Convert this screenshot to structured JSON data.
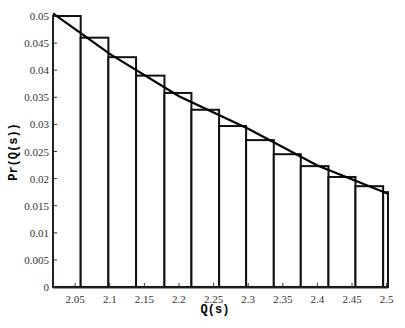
{
  "chart_data": {
    "type": "bar",
    "title": "",
    "xlabel": "Q(s)",
    "ylabel": "Pr(Q(s))",
    "xlim": [
      2.018,
      2.502
    ],
    "ylim": [
      0,
      0.05
    ],
    "x_ticks": [
      "2.05",
      "2.1",
      "2.15",
      "2.2",
      "2.25",
      "2.3",
      "2.35",
      "2.4",
      "2.45",
      "2.5"
    ],
    "y_ticks": [
      "0",
      "0.005",
      "0.01",
      "0.015",
      "0.02",
      "0.025",
      "0.03",
      "0.035",
      "0.04",
      "0.045",
      "0.05"
    ],
    "bin_edges": [
      2.018,
      2.058,
      2.098,
      2.138,
      2.179,
      2.218,
      2.258,
      2.297,
      2.337,
      2.376,
      2.416,
      2.455,
      2.495,
      2.502
    ],
    "values": [
      0.05,
      0.046,
      0.0424,
      0.039,
      0.0358,
      0.0327,
      0.0297,
      0.0271,
      0.0245,
      0.0223,
      0.0203,
      0.0186,
      0.0175
    ],
    "series": [
      {
        "name": "histogram",
        "type": "bar"
      },
      {
        "name": "fitted curve",
        "type": "line",
        "x": [
          2.018,
          2.1,
          2.2,
          2.3,
          2.4,
          2.502
        ],
        "y": [
          0.0505,
          0.043,
          0.0352,
          0.0292,
          0.0224,
          0.0172
        ]
      }
    ],
    "grid": false,
    "legend": null
  }
}
